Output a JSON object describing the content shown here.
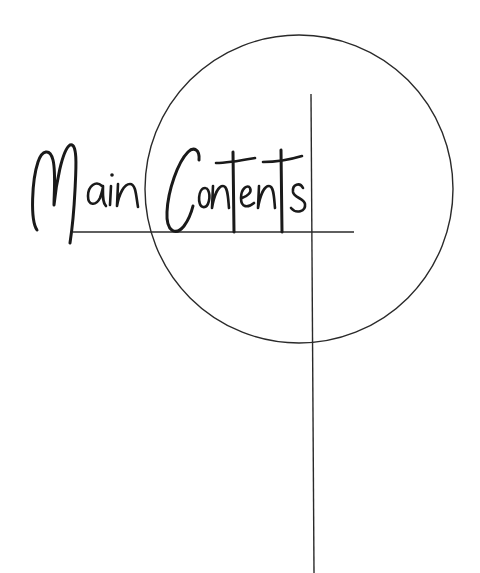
{
  "title": {
    "text": "Main Contents",
    "words": [
      "Main",
      "Contents"
    ]
  },
  "colors": {
    "background": "#ffffff",
    "ink": "#1a1a1a",
    "line": "#2a2a2a"
  },
  "decorations": {
    "circle": {
      "cx": 299,
      "cy": 189,
      "r": 154
    },
    "horizontal_line": {
      "x1": 73,
      "y1": 232,
      "x2": 354,
      "y2": 232
    },
    "vertical_line": {
      "x1": 311,
      "y1": 94,
      "x2": 314,
      "y2": 573
    }
  }
}
